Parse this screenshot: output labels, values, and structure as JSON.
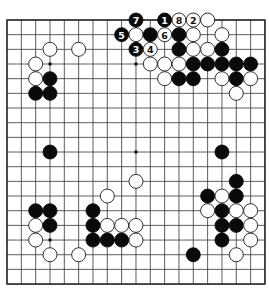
{
  "board": {
    "size": 19,
    "origin_x": 7,
    "origin_y": 20,
    "spacing_x": 14.33,
    "spacing_y": 14.67,
    "stone_radius": 7,
    "colors": {
      "black": "#0a0a0a",
      "white": "#ffffff",
      "line": "#333333",
      "background": "#ffffff"
    },
    "star_points": [
      [
        3,
        3
      ],
      [
        3,
        9
      ],
      [
        3,
        15
      ],
      [
        9,
        3
      ],
      [
        9,
        9
      ],
      [
        9,
        15
      ],
      [
        15,
        3
      ],
      [
        15,
        9
      ],
      [
        15,
        15
      ]
    ]
  },
  "stones": [
    {
      "row": 0,
      "col": 9,
      "color": "black",
      "label": "7"
    },
    {
      "row": 0,
      "col": 11,
      "color": "black",
      "label": "1"
    },
    {
      "row": 0,
      "col": 12,
      "color": "white",
      "label": "8"
    },
    {
      "row": 0,
      "col": 13,
      "color": "white",
      "label": "2"
    },
    {
      "row": 0,
      "col": 14,
      "color": "white",
      "label": ""
    },
    {
      "row": 1,
      "col": 8,
      "color": "black",
      "label": "5"
    },
    {
      "row": 1,
      "col": 9,
      "color": "white",
      "label": ""
    },
    {
      "row": 1,
      "col": 10,
      "color": "black",
      "label": ""
    },
    {
      "row": 1,
      "col": 11,
      "color": "white",
      "label": "6"
    },
    {
      "row": 1,
      "col": 12,
      "color": "black",
      "label": ""
    },
    {
      "row": 1,
      "col": 13,
      "color": "white",
      "label": ""
    },
    {
      "row": 1,
      "col": 15,
      "color": "white",
      "label": ""
    },
    {
      "row": 2,
      "col": 3,
      "color": "white",
      "label": ""
    },
    {
      "row": 2,
      "col": 5,
      "color": "white",
      "label": ""
    },
    {
      "row": 2,
      "col": 9,
      "color": "black",
      "label": "3"
    },
    {
      "row": 2,
      "col": 10,
      "color": "white",
      "label": "4"
    },
    {
      "row": 2,
      "col": 12,
      "color": "black",
      "label": ""
    },
    {
      "row": 2,
      "col": 13,
      "color": "white",
      "label": ""
    },
    {
      "row": 2,
      "col": 14,
      "color": "white",
      "label": ""
    },
    {
      "row": 2,
      "col": 15,
      "color": "black",
      "label": ""
    },
    {
      "row": 3,
      "col": 2,
      "color": "white",
      "label": ""
    },
    {
      "row": 3,
      "col": 10,
      "color": "white",
      "label": ""
    },
    {
      "row": 3,
      "col": 11,
      "color": "white",
      "label": ""
    },
    {
      "row": 3,
      "col": 12,
      "color": "white",
      "label": ""
    },
    {
      "row": 3,
      "col": 13,
      "color": "black",
      "label": ""
    },
    {
      "row": 3,
      "col": 14,
      "color": "black",
      "label": ""
    },
    {
      "row": 3,
      "col": 15,
      "color": "black",
      "label": ""
    },
    {
      "row": 3,
      "col": 16,
      "color": "black",
      "label": ""
    },
    {
      "row": 3,
      "col": 17,
      "color": "black",
      "label": ""
    },
    {
      "row": 4,
      "col": 2,
      "color": "white",
      "label": ""
    },
    {
      "row": 4,
      "col": 3,
      "color": "black",
      "label": ""
    },
    {
      "row": 4,
      "col": 11,
      "color": "white",
      "label": ""
    },
    {
      "row": 4,
      "col": 12,
      "color": "black",
      "label": ""
    },
    {
      "row": 4,
      "col": 13,
      "color": "black",
      "label": ""
    },
    {
      "row": 4,
      "col": 15,
      "color": "white",
      "label": ""
    },
    {
      "row": 4,
      "col": 16,
      "color": "black",
      "label": ""
    },
    {
      "row": 4,
      "col": 17,
      "color": "white",
      "label": ""
    },
    {
      "row": 5,
      "col": 2,
      "color": "black",
      "label": ""
    },
    {
      "row": 5,
      "col": 3,
      "color": "black",
      "label": ""
    },
    {
      "row": 5,
      "col": 16,
      "color": "white",
      "label": ""
    },
    {
      "row": 9,
      "col": 3,
      "color": "black",
      "label": ""
    },
    {
      "row": 9,
      "col": 15,
      "color": "black",
      "label": ""
    },
    {
      "row": 11,
      "col": 9,
      "color": "white",
      "label": ""
    },
    {
      "row": 11,
      "col": 16,
      "color": "black",
      "label": ""
    },
    {
      "row": 12,
      "col": 7,
      "color": "white",
      "label": ""
    },
    {
      "row": 12,
      "col": 14,
      "color": "black",
      "label": ""
    },
    {
      "row": 12,
      "col": 15,
      "color": "white",
      "label": ""
    },
    {
      "row": 12,
      "col": 16,
      "color": "black",
      "label": ""
    },
    {
      "row": 13,
      "col": 2,
      "color": "black",
      "label": ""
    },
    {
      "row": 13,
      "col": 3,
      "color": "black",
      "label": ""
    },
    {
      "row": 13,
      "col": 6,
      "color": "black",
      "label": ""
    },
    {
      "row": 13,
      "col": 14,
      "color": "white",
      "label": ""
    },
    {
      "row": 13,
      "col": 15,
      "color": "black",
      "label": ""
    },
    {
      "row": 13,
      "col": 16,
      "color": "white",
      "label": ""
    },
    {
      "row": 13,
      "col": 17,
      "color": "white",
      "label": ""
    },
    {
      "row": 14,
      "col": 2,
      "color": "white",
      "label": ""
    },
    {
      "row": 14,
      "col": 3,
      "color": "black",
      "label": ""
    },
    {
      "row": 14,
      "col": 6,
      "color": "black",
      "label": ""
    },
    {
      "row": 14,
      "col": 7,
      "color": "white",
      "label": ""
    },
    {
      "row": 14,
      "col": 8,
      "color": "white",
      "label": ""
    },
    {
      "row": 14,
      "col": 9,
      "color": "white",
      "label": ""
    },
    {
      "row": 14,
      "col": 15,
      "color": "black",
      "label": ""
    },
    {
      "row": 14,
      "col": 16,
      "color": "black",
      "label": ""
    },
    {
      "row": 14,
      "col": 17,
      "color": "white",
      "label": ""
    },
    {
      "row": 15,
      "col": 2,
      "color": "white",
      "label": ""
    },
    {
      "row": 15,
      "col": 6,
      "color": "black",
      "label": ""
    },
    {
      "row": 15,
      "col": 7,
      "color": "black",
      "label": ""
    },
    {
      "row": 15,
      "col": 8,
      "color": "black",
      "label": ""
    },
    {
      "row": 15,
      "col": 9,
      "color": "white",
      "label": ""
    },
    {
      "row": 15,
      "col": 15,
      "color": "black",
      "label": ""
    },
    {
      "row": 15,
      "col": 17,
      "color": "white",
      "label": ""
    },
    {
      "row": 16,
      "col": 3,
      "color": "white",
      "label": ""
    },
    {
      "row": 16,
      "col": 5,
      "color": "white",
      "label": ""
    },
    {
      "row": 16,
      "col": 13,
      "color": "black",
      "label": ""
    },
    {
      "row": 16,
      "col": 16,
      "color": "white",
      "label": ""
    }
  ]
}
